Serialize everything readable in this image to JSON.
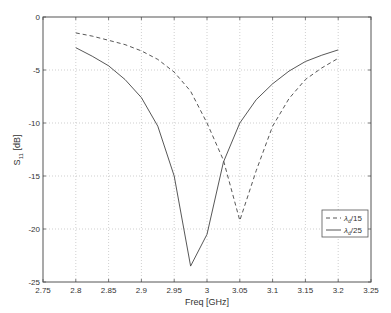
{
  "chart_data": {
    "type": "line",
    "title": "",
    "xlabel": "Freq [GHz]",
    "ylabel_main": "S",
    "ylabel_sub": "11",
    "ylabel_unit": " [dB]",
    "xlim": [
      2.75,
      3.25
    ],
    "ylim": [
      -25,
      0
    ],
    "xticks": [
      2.75,
      2.8,
      2.85,
      2.9,
      2.95,
      3.0,
      3.05,
      3.1,
      3.15,
      3.2,
      3.25
    ],
    "xtick_labels": [
      "2.75",
      "2.8",
      "2.85",
      "2.9",
      "2.95",
      "3",
      "3.05",
      "3.1",
      "3.15",
      "3.2",
      "3.25"
    ],
    "yticks": [
      0,
      -5,
      -10,
      -15,
      -20,
      -25
    ],
    "ytick_labels": [
      "0",
      "-5",
      "-10",
      "-15",
      "-20",
      "-25"
    ],
    "grid": true,
    "legend_position": "lower right",
    "x": [
      2.8,
      2.825,
      2.85,
      2.875,
      2.9,
      2.925,
      2.95,
      2.975,
      3.0,
      3.025,
      3.05,
      3.075,
      3.1,
      3.125,
      3.15,
      3.175,
      3.2
    ],
    "series": [
      {
        "name": "λd/15",
        "legend_main": "λ",
        "legend_sub": "d",
        "legend_tail": "/15",
        "style": "dashed",
        "values": [
          -1.5,
          -1.8,
          -2.2,
          -2.6,
          -3.2,
          -4.0,
          -5.2,
          -7.0,
          -10.0,
          -13.5,
          -19.2,
          -14.5,
          -10.3,
          -7.7,
          -5.9,
          -4.8,
          -3.9
        ]
      },
      {
        "name": "λd/25",
        "legend_main": "λ",
        "legend_sub": "d",
        "legend_tail": "/25",
        "style": "solid",
        "values": [
          -2.9,
          -3.7,
          -4.6,
          -5.9,
          -7.6,
          -10.3,
          -15.0,
          -23.5,
          -20.5,
          -13.7,
          -10.0,
          -7.8,
          -6.3,
          -5.1,
          -4.2,
          -3.6,
          -3.1
        ]
      }
    ],
    "colors": {
      "axis": "#555555",
      "grid": "#b0b0b0",
      "line": "#444444"
    }
  }
}
